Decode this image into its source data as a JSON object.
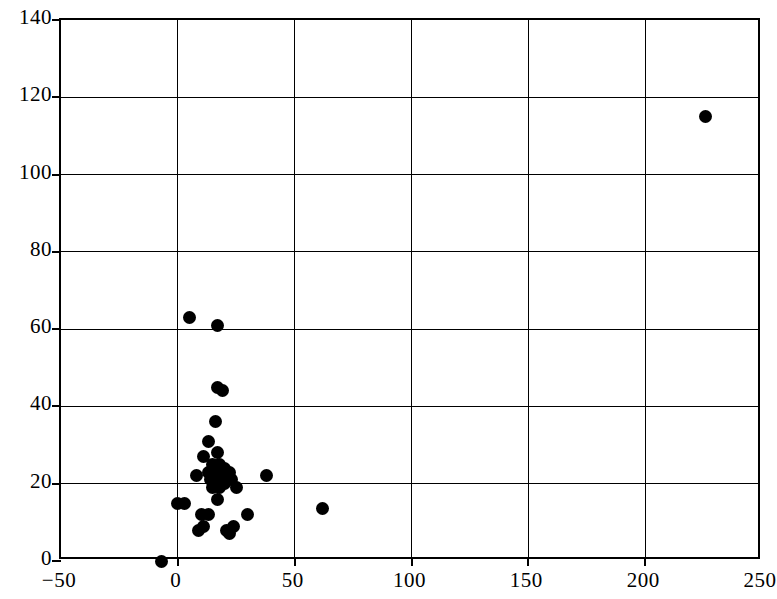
{
  "chart_data": {
    "type": "scatter",
    "title": "",
    "subtitle": "",
    "xlabel": "",
    "ylabel": "",
    "xlim": [
      -50,
      250
    ],
    "ylim": [
      0,
      140
    ],
    "xticks": [
      -50,
      0,
      50,
      100,
      150,
      200,
      250
    ],
    "yticks": [
      0,
      20,
      40,
      60,
      80,
      100,
      120,
      140
    ],
    "xtick_labels": [
      "−50",
      "0",
      "50",
      "100",
      "150",
      "200",
      "250"
    ],
    "ytick_labels": [
      "0",
      "20",
      "40",
      "60",
      "80",
      "100",
      "120",
      "140"
    ],
    "grid": true,
    "legend": null,
    "marker": "filled-circle",
    "marker_color": "#000000",
    "marker_size": 13,
    "n_points": 38,
    "points": [
      {
        "x": -7,
        "y": 0
      },
      {
        "x": 0,
        "y": 15
      },
      {
        "x": 5,
        "y": 63
      },
      {
        "x": 17,
        "y": 61
      },
      {
        "x": 17,
        "y": 45
      },
      {
        "x": 19,
        "y": 44
      },
      {
        "x": 16,
        "y": 36
      },
      {
        "x": 13,
        "y": 31
      },
      {
        "x": 11,
        "y": 27
      },
      {
        "x": 17,
        "y": 28
      },
      {
        "x": 15,
        "y": 25
      },
      {
        "x": 18,
        "y": 25
      },
      {
        "x": 20,
        "y": 24
      },
      {
        "x": 8,
        "y": 22
      },
      {
        "x": 13,
        "y": 23
      },
      {
        "x": 16,
        "y": 22
      },
      {
        "x": 19,
        "y": 22
      },
      {
        "x": 22,
        "y": 23
      },
      {
        "x": 14,
        "y": 21
      },
      {
        "x": 17,
        "y": 20
      },
      {
        "x": 20,
        "y": 20
      },
      {
        "x": 23,
        "y": 21
      },
      {
        "x": 15,
        "y": 19
      },
      {
        "x": 18,
        "y": 19
      },
      {
        "x": 25,
        "y": 19
      },
      {
        "x": 38,
        "y": 22
      },
      {
        "x": 17,
        "y": 16
      },
      {
        "x": 3,
        "y": 15
      },
      {
        "x": 62,
        "y": 13.5
      },
      {
        "x": 10,
        "y": 12
      },
      {
        "x": 13,
        "y": 12
      },
      {
        "x": 30,
        "y": 12
      },
      {
        "x": 9,
        "y": 8
      },
      {
        "x": 11,
        "y": 9
      },
      {
        "x": 21,
        "y": 8
      },
      {
        "x": 24,
        "y": 9
      },
      {
        "x": 22,
        "y": 7
      },
      {
        "x": 226,
        "y": 115
      }
    ]
  }
}
